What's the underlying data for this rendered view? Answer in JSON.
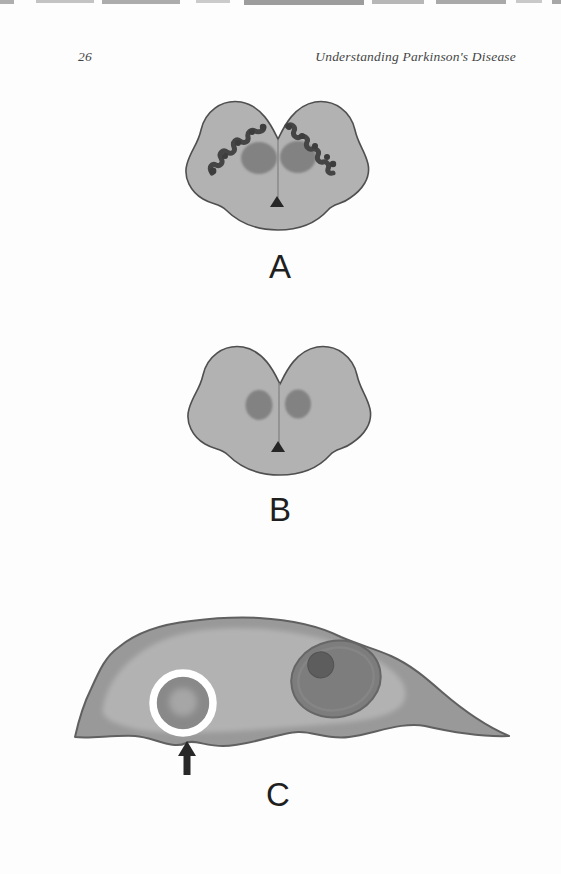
{
  "page": {
    "number": "26",
    "running_header": "Understanding Parkinson's Disease"
  },
  "figures": {
    "panel_a": {
      "label": "A"
    },
    "panel_b": {
      "label": "B"
    },
    "panel_c": {
      "label": "C"
    }
  },
  "palette": {
    "page_background": "#fdfdfd",
    "brain_body": "#b2b2b2",
    "brain_outline": "#4f4f4f",
    "red_nucleus": "#828282",
    "substantia_nigra_pigment": "#454545",
    "aqueduct_triangle": "#262626",
    "cell_body_outer": "#999999",
    "cell_body_inner": "#b2b2b2",
    "cell_outline": "#606060",
    "nucleus": "#7d7d7d",
    "nucleolus": "#5d5d5d",
    "lewy_body": "#898989",
    "lewy_body_core": "#a6a6a6",
    "lewy_halo": "#ffffff",
    "arrow": "#282828",
    "label_text": "#1f1f1f"
  }
}
